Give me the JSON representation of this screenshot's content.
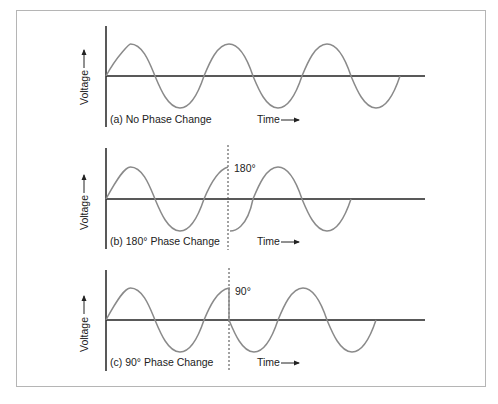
{
  "figure": {
    "panels": [
      {
        "id": "a",
        "caption": "(a)  No Phase Change",
        "ylabel": "Voltage",
        "xlabel": "Time",
        "phase_label": ""
      },
      {
        "id": "b",
        "caption": "(b)  180°  Phase Change",
        "ylabel": "Voltage",
        "xlabel": "Time",
        "phase_label": "180°"
      },
      {
        "id": "c",
        "caption": "(c)  90°  Phase Change",
        "ylabel": "Voltage",
        "xlabel": "Time",
        "phase_label": "90°"
      }
    ],
    "colors": {
      "wave": "#8a8a8a",
      "axis": "#222222",
      "frame": "#b5b5b5"
    }
  }
}
